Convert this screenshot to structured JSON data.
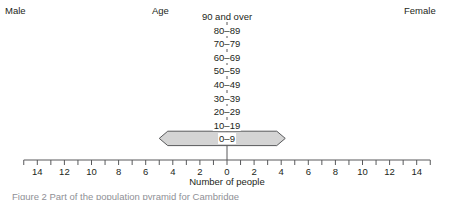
{
  "header": {
    "left_label": "Male",
    "center_label": "Age",
    "right_label": "Female"
  },
  "caption": "Figure 2 Part of the population pyramid for Cambridge",
  "chart_data": {
    "type": "bar",
    "subtype": "population-pyramid",
    "title": "",
    "xlabel": "Number of people",
    "ylabel": "Age",
    "grid": false,
    "legend": [
      "Male",
      "Female"
    ],
    "legend_position": "top-outside",
    "orientation": "horizontal",
    "xlim": [
      -15,
      15
    ],
    "xtick_step": 1,
    "xtick_label_step": 2,
    "xtick_labels": [
      "14",
      "12",
      "10",
      "8",
      "6",
      "4",
      "2",
      "0",
      "2",
      "4",
      "6",
      "8",
      "10",
      "12",
      "14"
    ],
    "xtick_values": [
      -14,
      -12,
      -10,
      -8,
      -6,
      -4,
      -2,
      0,
      2,
      4,
      6,
      8,
      10,
      12,
      14
    ],
    "categories": [
      "90 and over",
      "80–89",
      "70–79",
      "60–69",
      "50–59",
      "40–49",
      "30–39",
      "20–29",
      "10–19",
      "0–9"
    ],
    "series": [
      {
        "name": "Male",
        "values": [
          0,
          0,
          0,
          0,
          0,
          0,
          0,
          0,
          0,
          5.0
        ]
      },
      {
        "name": "Female",
        "values": [
          0,
          0,
          0,
          0,
          0,
          0,
          0,
          0,
          0,
          4.3
        ]
      }
    ],
    "bar_style": {
      "shape": "double-arrow-hexagon",
      "fill": "#d4d4d4",
      "stroke": "#58595b"
    },
    "axis_color": "#58595b",
    "text_color": "#231f20"
  }
}
